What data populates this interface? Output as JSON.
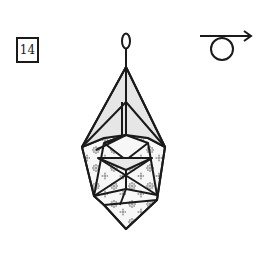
{
  "diagram": {
    "type": "origami-instruction-step",
    "step_number": "14",
    "instruction_symbol": "turn-over-rotate-icon",
    "colors": {
      "line": "#1a1a1a",
      "paper_back": "#e6e6e6",
      "paper_front": "#f7f7f7",
      "pattern": "#9a9a9a",
      "background": "#ffffff"
    }
  }
}
